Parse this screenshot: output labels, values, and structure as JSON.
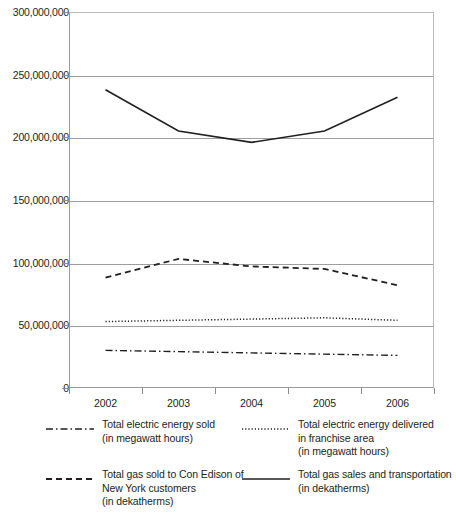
{
  "chart_data": {
    "type": "line",
    "title": "",
    "xlabel": "",
    "ylabel": "",
    "categories": [
      "2002",
      "2003",
      "2004",
      "2005",
      "2006"
    ],
    "x": [
      2002,
      2003,
      2004,
      2005,
      2006
    ],
    "ylim": [
      0,
      300000000
    ],
    "ytick_values": [
      0,
      50000000,
      100000000,
      150000000,
      200000000,
      250000000,
      300000000
    ],
    "ytick_labels": [
      "0",
      "50,000,000",
      "100,000,000",
      "150,000,000",
      "200,000,000",
      "250,000,000",
      "300,000,000"
    ],
    "grid": true,
    "legend_position": "below",
    "series": [
      {
        "name": "Total electric energy sold\n(in megawatt hours)",
        "label_line1": "Total electric energy sold",
        "label_line2": "(in megawatt hours)",
        "style": "dash-dot",
        "color": "#231f20",
        "values": [
          30000000,
          29000000,
          28000000,
          27000000,
          26000000
        ]
      },
      {
        "name": "Total electric energy delivered\nin franchise area\n(in megawatt hours)",
        "label_line1": "Total electric energy delivered",
        "label_line2": "in franchise area",
        "label_line3": "(in megawatt hours)",
        "style": "dotted",
        "color": "#231f20",
        "values": [
          53000000,
          54000000,
          55000000,
          56000000,
          54000000
        ]
      },
      {
        "name": "Total gas sold to Con Edison of\nNew York customers\n(in dekatherms)",
        "label_line1": "Total gas sold to Con Edison of",
        "label_line2": "New York customers",
        "label_line3": "(in dekatherms)",
        "style": "dashed",
        "color": "#231f20",
        "values": [
          88000000,
          103000000,
          97000000,
          95000000,
          82000000
        ]
      },
      {
        "name": "Total gas sales and transportation\n(in dekatherms)",
        "label_line1": "Total gas sales and transportation",
        "label_line2": "(in dekatherms)",
        "style": "solid",
        "color": "#231f20",
        "values": [
          238000000,
          205000000,
          196000000,
          205000000,
          232000000
        ]
      }
    ]
  },
  "legend": {
    "items": [
      {
        "swatch": "dash-dot-line-swatch",
        "line1": "Total electric energy sold",
        "line2": "(in megawatt hours)",
        "line3": ""
      },
      {
        "swatch": "dotted-line-swatch",
        "line1": "Total electric energy delivered",
        "line2": "in franchise area",
        "line3": "(in megawatt hours)"
      },
      {
        "swatch": "dashed-line-swatch",
        "line1": "Total gas sold to Con Edison of",
        "line2": "New York customers",
        "line3": "(in dekatherms)"
      },
      {
        "swatch": "solid-line-swatch",
        "line1": "Total gas sales and transportation",
        "line2": "(in dekatherms)",
        "line3": ""
      }
    ]
  }
}
